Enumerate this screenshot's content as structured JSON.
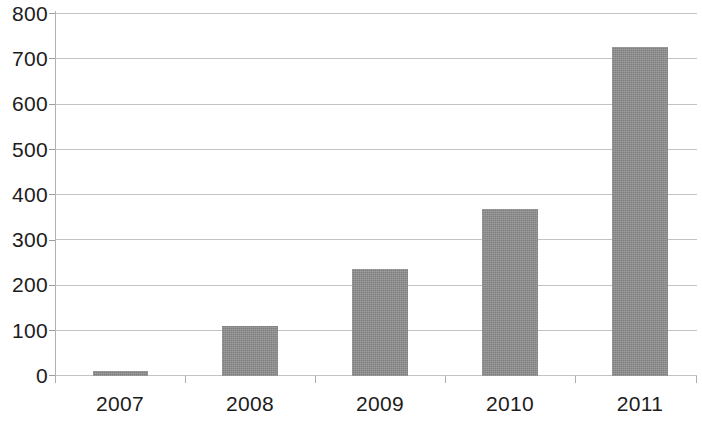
{
  "chart_data": {
    "type": "bar",
    "title": "",
    "subtitle": "",
    "xlabel": "",
    "ylabel": "",
    "categories": [
      "2007",
      "2008",
      "2009",
      "2010",
      "2011"
    ],
    "values": [
      12,
      110,
      237,
      370,
      728
    ],
    "series": [
      {
        "name": "",
        "values": [
          12,
          110,
          237,
          370,
          728
        ]
      }
    ],
    "ylim": [
      0,
      800
    ],
    "y_ticks": [
      0,
      100,
      200,
      300,
      400,
      500,
      600,
      700,
      800
    ],
    "y_tick_labels": [
      "0",
      "100",
      "200",
      "300",
      "400",
      "500",
      "600",
      "700",
      "800"
    ],
    "grid": true,
    "grid_axis": "y",
    "legend": false,
    "legend_position": "none",
    "bar_color": "#8b8b8b",
    "gridline_color": "#b9b9b9",
    "axis_color": "#b0b0b0",
    "background_color": "#ffffff",
    "text_color": "#1c1c1c",
    "annotations": []
  }
}
